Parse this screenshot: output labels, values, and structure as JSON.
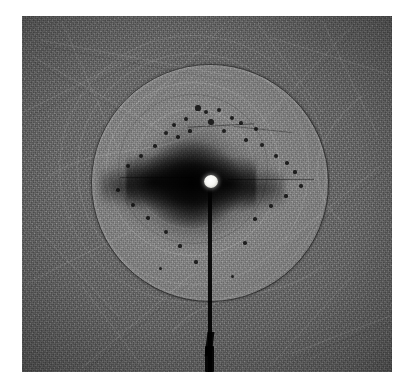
{
  "figure": {
    "kind": "x-ray-laue-diffraction-photograph",
    "medium": "grayscale photographic film plate",
    "caption": "",
    "plate": {
      "x": 22,
      "y": 16,
      "width": 370,
      "height": 356,
      "background_color": "#6e6e6e",
      "border_color": "#ffffff",
      "grain": "fine photographic grain with faint diagonal handling scratches"
    }
  },
  "chart_data": {
    "type": "scatter",
    "title": "",
    "subtitle": "",
    "xlabel": "",
    "ylabel": "",
    "grid": false,
    "legend": null,
    "colormap": "grayscale (dark = high exposure)",
    "background_level": "#6e6e6e",
    "halo": {
      "label": "primary diffraction halo",
      "center_x": 209,
      "center_y": 182,
      "radius": 118,
      "interior_level": "#8a8a8a",
      "rim_color": "#141414",
      "rim_width_px": 1.4
    },
    "faint_rings": [
      {
        "label": "inner diffuse ring",
        "radius": 86,
        "opacity": 0.16
      },
      {
        "label": "mid diffuse ring",
        "radius": 60,
        "opacity": 0.13
      },
      {
        "label": "outer echo ring",
        "radius": 132,
        "opacity": 0.1
      },
      {
        "label": "far echo ring",
        "radius": 150,
        "opacity": 0.07
      }
    ],
    "direct_beam": {
      "label": "direct beam spot",
      "x": 211,
      "y": 182,
      "radius_px": 7,
      "intensity": "saturated white",
      "color": "#ffffff"
    },
    "beam_stop": {
      "label": "beam stop shadow",
      "orientation": "vertical",
      "from_y": 186,
      "to_y": 372,
      "x": 210,
      "width_px": 4,
      "color": "#000000"
    },
    "central_lobes": {
      "label": "central dark scattering lobes",
      "count": 4,
      "axes": "horizontal pair dominant, vertical pair diffuse"
    },
    "reflections": [
      {
        "x": 198,
        "y": 108,
        "r": 2.6
      },
      {
        "x": 206,
        "y": 112,
        "r": 2.0
      },
      {
        "x": 219,
        "y": 110,
        "r": 2.4
      },
      {
        "x": 232,
        "y": 118,
        "r": 2.2
      },
      {
        "x": 241,
        "y": 123,
        "r": 1.8
      },
      {
        "x": 256,
        "y": 129,
        "r": 2.0
      },
      {
        "x": 186,
        "y": 119,
        "r": 1.9
      },
      {
        "x": 174,
        "y": 125,
        "r": 2.4
      },
      {
        "x": 166,
        "y": 133,
        "r": 2.0
      },
      {
        "x": 178,
        "y": 137,
        "r": 1.7
      },
      {
        "x": 190,
        "y": 131,
        "r": 1.6
      },
      {
        "x": 211,
        "y": 122,
        "r": 2.8
      },
      {
        "x": 224,
        "y": 131,
        "r": 2.1
      },
      {
        "x": 246,
        "y": 140,
        "r": 1.7
      },
      {
        "x": 262,
        "y": 145,
        "r": 1.9
      },
      {
        "x": 155,
        "y": 146,
        "r": 1.8
      },
      {
        "x": 141,
        "y": 156,
        "r": 2.2
      },
      {
        "x": 128,
        "y": 166,
        "r": 2.0
      },
      {
        "x": 276,
        "y": 156,
        "r": 2.1
      },
      {
        "x": 287,
        "y": 163,
        "r": 1.8
      },
      {
        "x": 295,
        "y": 172,
        "r": 1.6
      },
      {
        "x": 133,
        "y": 205,
        "r": 2.0
      },
      {
        "x": 148,
        "y": 218,
        "r": 1.7
      },
      {
        "x": 166,
        "y": 232,
        "r": 1.9
      },
      {
        "x": 180,
        "y": 246,
        "r": 1.6
      },
      {
        "x": 255,
        "y": 219,
        "r": 1.8
      },
      {
        "x": 271,
        "y": 206,
        "r": 1.7
      },
      {
        "x": 286,
        "y": 196,
        "r": 1.6
      },
      {
        "x": 245,
        "y": 243,
        "r": 1.7
      },
      {
        "x": 196,
        "y": 262,
        "r": 1.6
      },
      {
        "x": 118,
        "y": 190,
        "r": 1.8
      },
      {
        "x": 301,
        "y": 186,
        "r": 1.7
      },
      {
        "x": 160,
        "y": 268,
        "r": 1.5
      },
      {
        "x": 232,
        "y": 276,
        "r": 1.5
      }
    ],
    "horizontal_streaks": [
      {
        "label": "left equatorial streak",
        "x": 120,
        "y": 178,
        "length": 74,
        "thickness": 1.4
      },
      {
        "label": "right equatorial streak",
        "x": 228,
        "y": 180,
        "length": 86,
        "thickness": 1.4
      },
      {
        "label": "upper arc streak",
        "x": 188,
        "y": 126,
        "length": 66,
        "thickness": 1.2
      }
    ]
  }
}
